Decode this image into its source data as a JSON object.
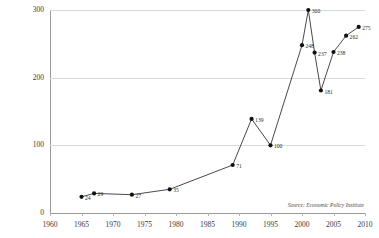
{
  "chart_data": {
    "type": "line",
    "title": "",
    "subtitle": "",
    "xlabel": "",
    "ylabel": "",
    "xlim": [
      1960,
      2010
    ],
    "ylim": [
      0,
      300
    ],
    "grid": true,
    "legend": false,
    "y_ticks": [
      "0",
      "100",
      "200",
      "300"
    ],
    "y_tick_values": [
      0,
      100,
      200,
      300
    ],
    "x_ticks": [
      "1960",
      "1965",
      "1970",
      "1975",
      "1980",
      "1985",
      "1990",
      "1995",
      "2000",
      "2005",
      "2010"
    ],
    "x_tick_values": [
      1960,
      1965,
      1970,
      1975,
      1980,
      1985,
      1990,
      1995,
      2000,
      2005,
      2010
    ],
    "series": [
      {
        "name": "CEO-to-worker pay ratio",
        "x": [
          1965,
          1967,
          1973,
          1979,
          1989,
          1992,
          1995,
          2000,
          2001,
          2002,
          2003,
          2005,
          2007,
          2009
        ],
        "values": [
          24,
          29,
          27,
          35,
          71,
          139,
          100,
          248,
          300,
          237,
          181,
          238,
          262,
          275
        ],
        "labels": [
          "24",
          "29",
          "27",
          "35",
          "71",
          "139",
          "100",
          "248",
          "300",
          "237",
          "181",
          "238",
          "262",
          "275"
        ]
      }
    ],
    "annotations": [
      {
        "name": "source-note",
        "text": "Source: Economic Policy Institute"
      }
    ]
  }
}
